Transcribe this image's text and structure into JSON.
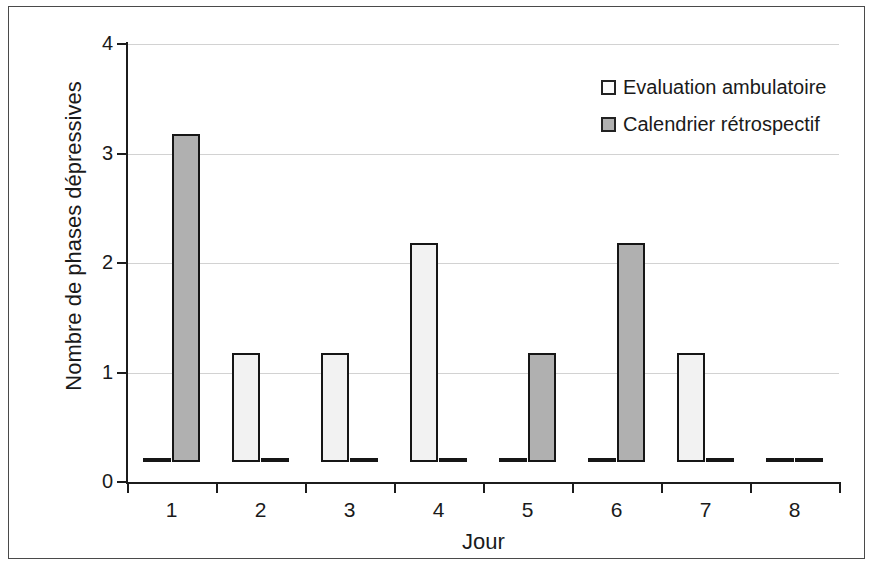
{
  "chart_data": {
    "type": "bar",
    "title": "",
    "xlabel": "Jour",
    "ylabel": "Nombre de phases dépressives",
    "categories": [
      "1",
      "2",
      "3",
      "4",
      "5",
      "6",
      "7",
      "8"
    ],
    "series": [
      {
        "name": "Evaluation ambulatoire",
        "color": "#f2f2f2",
        "values": [
          0,
          1,
          1,
          2,
          0,
          0,
          1,
          0
        ]
      },
      {
        "name": "Calendrier rétrospectif",
        "color": "#b0b0b0",
        "values": [
          3,
          0,
          0,
          0,
          1,
          2,
          0,
          0
        ]
      }
    ],
    "ylim": [
      0,
      4
    ],
    "ytick_labels": [
      "0",
      "1",
      "2",
      "3",
      "4"
    ],
    "ytick_values": [
      0,
      1,
      2,
      3,
      4
    ],
    "grid": true,
    "grid_axis": "y",
    "legend_position": "top-right",
    "bar_border_color": "#161616",
    "axis_color": "#1c1c1c",
    "gridline_color": "#d2d2d2"
  },
  "legend": {
    "items": [
      {
        "label": "Evaluation ambulatoire"
      },
      {
        "label": "Calendrier rétrospectif"
      }
    ]
  },
  "axes": {
    "y_title": "Nombre de phases dépressives",
    "x_title": "Jour"
  }
}
